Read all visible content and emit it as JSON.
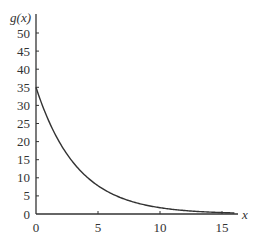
{
  "chart_data": {
    "type": "line",
    "title": "",
    "xlabel": "x",
    "ylabel": "g(x)",
    "xlim": [
      0,
      16
    ],
    "ylim": [
      0,
      50
    ],
    "xticks": [
      0,
      5,
      10,
      15
    ],
    "yticks": [
      0,
      5,
      10,
      15,
      20,
      25,
      30,
      35,
      40,
      45,
      50
    ],
    "grid": false,
    "legend": null,
    "series": [
      {
        "name": "g(x)",
        "function": "35*exp(-0.3x)",
        "x": [
          0,
          1,
          2,
          3,
          4,
          5,
          6,
          7,
          8,
          9,
          10,
          11,
          12,
          13,
          14,
          15,
          16
        ],
        "y": [
          35,
          25.9,
          19.2,
          14.2,
          10.5,
          7.8,
          5.8,
          4.3,
          3.2,
          2.3,
          1.7,
          1.3,
          1.0,
          0.7,
          0.5,
          0.4,
          0.3
        ]
      }
    ]
  },
  "labels": {
    "ylabel": "g(x)",
    "xlabel": "x",
    "xticks": [
      "0",
      "5",
      "10",
      "15"
    ],
    "yticks": [
      "0",
      "5",
      "10",
      "15",
      "20",
      "25",
      "30",
      "35",
      "40",
      "45",
      "50"
    ]
  }
}
